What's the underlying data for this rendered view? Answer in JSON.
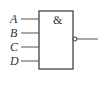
{
  "gate": {
    "type": "NAND",
    "symbol": "&",
    "inputs": [
      "A",
      "B",
      "C",
      "D"
    ],
    "output_inverted": true
  },
  "colors": {
    "stroke": "#333333",
    "background": "#ffffff"
  }
}
